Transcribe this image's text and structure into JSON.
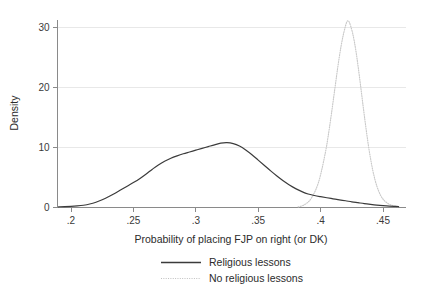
{
  "chart_data": {
    "type": "line",
    "title": "",
    "subtitle": "",
    "xlabel": "Probability of placing FJP on right (or DK)",
    "ylabel": "Density",
    "xlim": [
      0.188,
      0.4625
    ],
    "ylim": [
      0,
      32.5
    ],
    "xticks": [
      0.2,
      0.25,
      0.3,
      0.35,
      0.4,
      0.45
    ],
    "xticklabels": [
      ".2",
      ".25",
      ".3",
      ".35",
      ".4",
      ".45"
    ],
    "yticks": [
      0,
      10,
      20,
      30
    ],
    "yticklabels": [
      "0",
      "10",
      "20",
      "30"
    ],
    "grid": "horizontal",
    "legend_position": "below",
    "series": [
      {
        "name": "Religious lessons",
        "style": "solid",
        "color": "#3b3b3b",
        "peak_x": 0.322,
        "peak_y": 10.8,
        "points": [
          [
            0.19,
            0.12
          ],
          [
            0.195,
            0.14
          ],
          [
            0.2,
            0.18
          ],
          [
            0.205,
            0.26
          ],
          [
            0.21,
            0.38
          ],
          [
            0.215,
            0.58
          ],
          [
            0.22,
            0.88
          ],
          [
            0.225,
            1.28
          ],
          [
            0.23,
            1.78
          ],
          [
            0.235,
            2.35
          ],
          [
            0.24,
            2.95
          ],
          [
            0.245,
            3.55
          ],
          [
            0.25,
            4.15
          ],
          [
            0.255,
            4.8
          ],
          [
            0.26,
            5.55
          ],
          [
            0.265,
            6.35
          ],
          [
            0.27,
            7.1
          ],
          [
            0.275,
            7.7
          ],
          [
            0.28,
            8.2
          ],
          [
            0.285,
            8.6
          ],
          [
            0.29,
            8.95
          ],
          [
            0.295,
            9.25
          ],
          [
            0.3,
            9.55
          ],
          [
            0.305,
            9.85
          ],
          [
            0.31,
            10.15
          ],
          [
            0.315,
            10.45
          ],
          [
            0.32,
            10.72
          ],
          [
            0.325,
            10.8
          ],
          [
            0.33,
            10.65
          ],
          [
            0.335,
            10.25
          ],
          [
            0.34,
            9.6
          ],
          [
            0.345,
            8.8
          ],
          [
            0.35,
            7.9
          ],
          [
            0.355,
            7.0
          ],
          [
            0.36,
            6.1
          ],
          [
            0.365,
            5.25
          ],
          [
            0.37,
            4.45
          ],
          [
            0.375,
            3.75
          ],
          [
            0.38,
            3.15
          ],
          [
            0.385,
            2.65
          ],
          [
            0.39,
            2.25
          ],
          [
            0.395,
            2.0
          ],
          [
            0.4,
            1.8
          ],
          [
            0.405,
            1.62
          ],
          [
            0.41,
            1.45
          ],
          [
            0.415,
            1.28
          ],
          [
            0.42,
            1.12
          ],
          [
            0.425,
            0.95
          ],
          [
            0.43,
            0.8
          ],
          [
            0.435,
            0.65
          ],
          [
            0.44,
            0.52
          ],
          [
            0.445,
            0.4
          ],
          [
            0.45,
            0.3
          ],
          [
            0.455,
            0.22
          ],
          [
            0.46,
            0.18
          ],
          [
            0.4625,
            0.16
          ]
        ]
      },
      {
        "name": "No religious lessons",
        "style": "dotted",
        "color": "#c9c9c9",
        "peak_x": 0.4215,
        "peak_y": 31.1,
        "points": [
          [
            0.382,
            0.1
          ],
          [
            0.386,
            0.35
          ],
          [
            0.39,
            0.9
          ],
          [
            0.393,
            1.7
          ],
          [
            0.396,
            2.9
          ],
          [
            0.3985,
            4.3
          ],
          [
            0.4005,
            5.9
          ],
          [
            0.4025,
            7.8
          ],
          [
            0.4045,
            9.9
          ],
          [
            0.406,
            11.8
          ],
          [
            0.4075,
            13.9
          ],
          [
            0.409,
            16.1
          ],
          [
            0.4105,
            18.4
          ],
          [
            0.412,
            20.7
          ],
          [
            0.4135,
            23.0
          ],
          [
            0.415,
            25.1
          ],
          [
            0.4165,
            27.0
          ],
          [
            0.418,
            28.6
          ],
          [
            0.4195,
            29.9
          ],
          [
            0.4205,
            30.65
          ],
          [
            0.4215,
            31.1
          ],
          [
            0.4228,
            30.95
          ],
          [
            0.424,
            30.3
          ],
          [
            0.4255,
            29.2
          ],
          [
            0.427,
            27.7
          ],
          [
            0.4285,
            25.8
          ],
          [
            0.43,
            23.6
          ],
          [
            0.4315,
            21.2
          ],
          [
            0.433,
            18.7
          ],
          [
            0.4345,
            16.2
          ],
          [
            0.436,
            13.8
          ],
          [
            0.4375,
            11.5
          ],
          [
            0.439,
            9.4
          ],
          [
            0.4405,
            7.6
          ],
          [
            0.442,
            6.0
          ],
          [
            0.4435,
            4.7
          ],
          [
            0.445,
            3.6
          ],
          [
            0.4465,
            2.75
          ],
          [
            0.448,
            2.05
          ],
          [
            0.4495,
            1.55
          ],
          [
            0.451,
            1.15
          ],
          [
            0.453,
            0.8
          ],
          [
            0.455,
            0.55
          ],
          [
            0.457,
            0.38
          ],
          [
            0.459,
            0.26
          ],
          [
            0.461,
            0.18
          ],
          [
            0.4625,
            0.14
          ]
        ]
      }
    ]
  },
  "legend": {
    "items": [
      {
        "label": "Religious lessons"
      },
      {
        "label": "No religious lessons"
      }
    ]
  }
}
